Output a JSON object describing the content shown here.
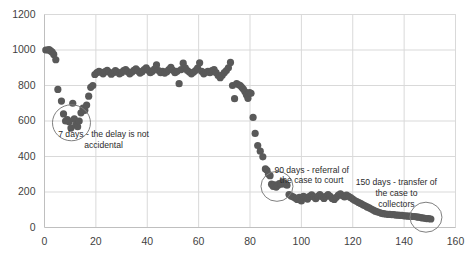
{
  "chart_data": {
    "type": "scatter",
    "title": "",
    "xlabel": "",
    "ylabel": "",
    "xlim": [
      0,
      160
    ],
    "ylim": [
      0,
      1200
    ],
    "xticks": [
      0,
      20,
      40,
      60,
      80,
      100,
      120,
      140,
      160
    ],
    "yticks": [
      0,
      200,
      400,
      600,
      800,
      1000,
      1200
    ],
    "grid": true,
    "legend": "none",
    "marker_color": "#595959",
    "marker_size": 3.6,
    "series": [
      {
        "name": "balance",
        "points": [
          [
            0.5,
            1000
          ],
          [
            1.2,
            1000
          ],
          [
            1.8,
            1002
          ],
          [
            2.4,
            995
          ],
          [
            3.0,
            988
          ],
          [
            3.6,
            975
          ],
          [
            4.4,
            945
          ],
          [
            5.2,
            778
          ],
          [
            6.6,
            712
          ],
          [
            7.4,
            640
          ],
          [
            8.2,
            600
          ],
          [
            8.9,
            608
          ],
          [
            9.6,
            596
          ],
          [
            10.3,
            560
          ],
          [
            11.0,
            700
          ],
          [
            11.6,
            612
          ],
          [
            12.2,
            578
          ],
          [
            12.9,
            568
          ],
          [
            13.5,
            600
          ],
          [
            14.2,
            646
          ],
          [
            15.0,
            672
          ],
          [
            15.7,
            660
          ],
          [
            16.4,
            690
          ],
          [
            17.2,
            740
          ],
          [
            18.0,
            790
          ],
          [
            18.8,
            800
          ],
          [
            19.6,
            862
          ],
          [
            20.4,
            872
          ],
          [
            21.2,
            880
          ],
          [
            22.0,
            874
          ],
          [
            22.8,
            866
          ],
          [
            23.6,
            878
          ],
          [
            24.4,
            886
          ],
          [
            25.2,
            874
          ],
          [
            26.0,
            864
          ],
          [
            26.8,
            872
          ],
          [
            27.6,
            884
          ],
          [
            28.4,
            876
          ],
          [
            29.2,
            866
          ],
          [
            30.0,
            872
          ],
          [
            30.8,
            884
          ],
          [
            31.6,
            890
          ],
          [
            32.4,
            878
          ],
          [
            33.2,
            866
          ],
          [
            34.0,
            874
          ],
          [
            34.8,
            886
          ],
          [
            35.6,
            894
          ],
          [
            36.4,
            882
          ],
          [
            37.2,
            870
          ],
          [
            38.0,
            878
          ],
          [
            38.8,
            890
          ],
          [
            39.6,
            900
          ],
          [
            40.4,
            886
          ],
          [
            41.2,
            872
          ],
          [
            42.0,
            880
          ],
          [
            42.8,
            892
          ],
          [
            43.6,
            916
          ],
          [
            44.4,
            884
          ],
          [
            45.2,
            872
          ],
          [
            46.0,
            880
          ],
          [
            46.8,
            870
          ],
          [
            47.6,
            878
          ],
          [
            48.4,
            890
          ],
          [
            49.2,
            902
          ],
          [
            50.0,
            886
          ],
          [
            50.8,
            872
          ],
          [
            51.6,
            880
          ],
          [
            52.4,
            810
          ],
          [
            53.2,
            890
          ],
          [
            54.0,
            926
          ],
          [
            54.8,
            900
          ],
          [
            55.6,
            884
          ],
          [
            56.4,
            876
          ],
          [
            57.2,
            866
          ],
          [
            58.0,
            874
          ],
          [
            58.8,
            884
          ],
          [
            59.6,
            898
          ],
          [
            60.4,
            928
          ],
          [
            61.2,
            880
          ],
          [
            62.0,
            866
          ],
          [
            62.8,
            874
          ],
          [
            63.6,
            880
          ],
          [
            64.4,
            872
          ],
          [
            65.2,
            884
          ],
          [
            66.0,
            890
          ],
          [
            66.8,
            872
          ],
          [
            67.6,
            856
          ],
          [
            68.4,
            844
          ],
          [
            69.2,
            858
          ],
          [
            70.0,
            872
          ],
          [
            70.8,
            884
          ],
          [
            71.6,
            900
          ],
          [
            72.4,
            930
          ],
          [
            73.2,
            800
          ],
          [
            74.0,
            726
          ],
          [
            74.8,
            810
          ],
          [
            75.6,
            804
          ],
          [
            76.2,
            800
          ],
          [
            76.8,
            790
          ],
          [
            77.4,
            780
          ],
          [
            78.0,
            766
          ],
          [
            78.6,
            748
          ],
          [
            79.2,
            728
          ],
          [
            79.8,
            760
          ],
          [
            80.4,
            756
          ],
          [
            81.2,
            620
          ],
          [
            82.0,
            530
          ],
          [
            83.0,
            462
          ],
          [
            84.0,
            430
          ],
          [
            85.0,
            398
          ],
          [
            86.0,
            330
          ],
          [
            86.6,
            322
          ],
          [
            87.2,
            300
          ],
          [
            87.8,
            292
          ],
          [
            88.4,
            244
          ],
          [
            89.0,
            232
          ],
          [
            89.6,
            240
          ],
          [
            90.2,
            228
          ],
          [
            90.8,
            236
          ],
          [
            91.4,
            248
          ],
          [
            92.0,
            244
          ],
          [
            92.6,
            256
          ],
          [
            93.2,
            250
          ],
          [
            93.8,
            244
          ],
          [
            94.4,
            238
          ],
          [
            95.2,
            186
          ],
          [
            96.0,
            178
          ],
          [
            96.8,
            172
          ],
          [
            97.6,
            166
          ],
          [
            98.4,
            158
          ],
          [
            99.2,
            170
          ],
          [
            100.0,
            150
          ],
          [
            100.8,
            176
          ],
          [
            101.6,
            170
          ],
          [
            102.4,
            160
          ],
          [
            103.2,
            176
          ],
          [
            104.0,
            184
          ],
          [
            104.8,
            172
          ],
          [
            105.6,
            162
          ],
          [
            106.4,
            176
          ],
          [
            107.2,
            186
          ],
          [
            108.0,
            174
          ],
          [
            108.8,
            164
          ],
          [
            109.6,
            176
          ],
          [
            110.4,
            186
          ],
          [
            111.2,
            176
          ],
          [
            112.0,
            164
          ],
          [
            112.8,
            158
          ],
          [
            113.6,
            170
          ],
          [
            114.4,
            182
          ],
          [
            115.2,
            190
          ],
          [
            116.0,
            180
          ],
          [
            116.8,
            172
          ],
          [
            117.6,
            182
          ],
          [
            118.4,
            176
          ],
          [
            119.2,
            168
          ],
          [
            120.0,
            160
          ],
          [
            120.8,
            152
          ],
          [
            121.6,
            146
          ],
          [
            122.4,
            140
          ],
          [
            123.2,
            134
          ],
          [
            124.0,
            128
          ],
          [
            124.8,
            122
          ],
          [
            125.6,
            116
          ],
          [
            126.4,
            110
          ],
          [
            127.2,
            104
          ],
          [
            128.0,
            98
          ],
          [
            128.8,
            92
          ],
          [
            129.6,
            88
          ],
          [
            130.4,
            84
          ],
          [
            131.2,
            80
          ],
          [
            132.0,
            78
          ],
          [
            132.8,
            76
          ],
          [
            133.6,
            74
          ],
          [
            134.4,
            74
          ],
          [
            135.2,
            72
          ],
          [
            136.0,
            72
          ],
          [
            136.8,
            70
          ],
          [
            137.6,
            70
          ],
          [
            138.4,
            68
          ],
          [
            139.2,
            68
          ],
          [
            140.0,
            66
          ],
          [
            140.8,
            66
          ],
          [
            141.6,
            64
          ],
          [
            142.4,
            64
          ],
          [
            143.2,
            62
          ],
          [
            144.0,
            62
          ],
          [
            144.8,
            60
          ],
          [
            145.6,
            58
          ],
          [
            146.4,
            56
          ],
          [
            147.2,
            54
          ],
          [
            148.0,
            52
          ],
          [
            148.8,
            50
          ],
          [
            149.6,
            50
          ],
          [
            150.4,
            48
          ]
        ]
      }
    ],
    "annotations": [
      {
        "id": "annotation-7-days",
        "text": "7 days - the delay is not\naccidental",
        "x": 23,
        "y": 520,
        "circle": {
          "x": 10.5,
          "y": 590,
          "rx": 19,
          "ry": 18
        }
      },
      {
        "id": "annotation-90-days",
        "text": "90 days - referral of\nthe case to court",
        "x": 104,
        "y": 320,
        "circle": {
          "x": 90.5,
          "y": 232,
          "rx": 16,
          "ry": 15
        }
      },
      {
        "id": "annotation-150-days",
        "text": "150 days - transfer of\nthe case to\ncollectors",
        "x": 137,
        "y": 250,
        "circle": {
          "x": 148.5,
          "y": 58,
          "rx": 16,
          "ry": 15
        }
      }
    ]
  },
  "axis": {
    "y_labels": [
      "1200",
      "1000",
      "800",
      "600",
      "400",
      "200",
      "0"
    ],
    "x_labels": [
      "0",
      "20",
      "40",
      "60",
      "80",
      "100",
      "120",
      "140",
      "160"
    ]
  },
  "colors": {
    "marker": "#595959",
    "grid": "#d9d9d9",
    "axis": "#bfbfbf",
    "circle": "#7f7f7f",
    "text": "#3f3f3f"
  }
}
